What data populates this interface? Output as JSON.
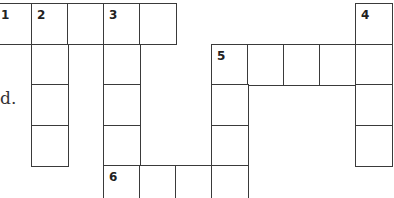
{
  "puzzle": {
    "type": "crossword",
    "cell_width": 36,
    "cell_height": 40.5,
    "origin_x": -5,
    "origin_y": 3,
    "text_fragment": "d.",
    "cells": [
      {
        "row": 0,
        "col": 0,
        "number": "1"
      },
      {
        "row": 0,
        "col": 1,
        "number": "2"
      },
      {
        "row": 0,
        "col": 2,
        "number": ""
      },
      {
        "row": 0,
        "col": 3,
        "number": "3"
      },
      {
        "row": 0,
        "col": 4,
        "number": ""
      },
      {
        "row": 0,
        "col": 10,
        "number": "4"
      },
      {
        "row": 1,
        "col": 1,
        "number": ""
      },
      {
        "row": 1,
        "col": 3,
        "number": ""
      },
      {
        "row": 1,
        "col": 6,
        "number": "5"
      },
      {
        "row": 1,
        "col": 7,
        "number": ""
      },
      {
        "row": 1,
        "col": 8,
        "number": ""
      },
      {
        "row": 1,
        "col": 9,
        "number": ""
      },
      {
        "row": 1,
        "col": 10,
        "number": ""
      },
      {
        "row": 2,
        "col": 1,
        "number": ""
      },
      {
        "row": 2,
        "col": 3,
        "number": ""
      },
      {
        "row": 2,
        "col": 6,
        "number": ""
      },
      {
        "row": 2,
        "col": 10,
        "number": ""
      },
      {
        "row": 3,
        "col": 1,
        "number": ""
      },
      {
        "row": 3,
        "col": 3,
        "number": ""
      },
      {
        "row": 3,
        "col": 6,
        "number": ""
      },
      {
        "row": 3,
        "col": 10,
        "number": ""
      },
      {
        "row": 4,
        "col": 3,
        "number": "6"
      },
      {
        "row": 4,
        "col": 4,
        "number": ""
      },
      {
        "row": 4,
        "col": 5,
        "number": ""
      },
      {
        "row": 4,
        "col": 6,
        "number": ""
      }
    ]
  }
}
